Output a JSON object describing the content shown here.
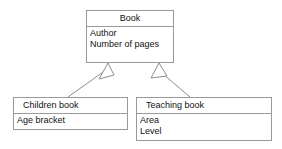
{
  "diagram": {
    "type": "uml-class-diagram",
    "background_color": "#ffffff",
    "line_color": "#8d8d8d",
    "border_color": "#9a9a9a",
    "text_color": "#111111",
    "classes": [
      {
        "id": "book",
        "name": "Book",
        "attributes": [
          "Author",
          "Number of pages"
        ],
        "box": {
          "x": 86,
          "y": 10,
          "width": 88,
          "height": 53
        },
        "title_align": "center"
      },
      {
        "id": "children-book",
        "name": "Children book",
        "attributes": [
          "Age bracket"
        ],
        "box": {
          "x": 13,
          "y": 97,
          "width": 115,
          "height": 33
        },
        "title_align": "left"
      },
      {
        "id": "teaching-book",
        "name": "Teaching book",
        "attributes": [
          "Area",
          "Level"
        ],
        "box": {
          "x": 136,
          "y": 97,
          "width": 136,
          "height": 44
        },
        "title_align": "left"
      }
    ],
    "relationships": [
      {
        "id": "children-book-generalizes-book",
        "kind": "generalization",
        "from": "children-book",
        "to": "book",
        "line": {
          "x1": 68,
          "y1": 97,
          "x2": 106,
          "y2": 70
        },
        "arrowhead": {
          "tip_x": 108,
          "tip_y": 63,
          "left_x": 99,
          "left_y": 79,
          "right_x": 114,
          "right_y": 75
        }
      },
      {
        "id": "teaching-book-generalizes-book",
        "kind": "generalization",
        "from": "teaching-book",
        "to": "book",
        "line": {
          "x1": 190,
          "y1": 97,
          "x2": 164,
          "y2": 73
        },
        "arrowhead": {
          "tip_x": 159,
          "tip_y": 63,
          "left_x": 152,
          "left_y": 78,
          "right_x": 167,
          "right_y": 76
        }
      }
    ]
  }
}
